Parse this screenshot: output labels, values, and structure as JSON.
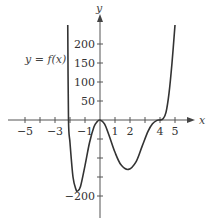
{
  "chart_data": {
    "type": "line",
    "title": "",
    "annotation": "y = f(x)",
    "xlabel": "x",
    "ylabel": "y",
    "xlim": [
      -5.5,
      6
    ],
    "ylim": [
      -240,
      250
    ],
    "x_ticks": [
      -5,
      -4,
      -3,
      -2,
      -1,
      0,
      1,
      2,
      3,
      4,
      5
    ],
    "x_tick_labels": [
      {
        "value": -5,
        "label": "−5"
      },
      {
        "value": -3,
        "label": "−3"
      },
      {
        "value": -1,
        "label": "−1"
      },
      {
        "value": 1,
        "label": "1"
      },
      {
        "value": 2,
        "label": "2"
      },
      {
        "value": 4,
        "label": "4"
      },
      {
        "value": 5,
        "label": "5"
      }
    ],
    "y_ticks": [
      -200,
      -150,
      -100,
      -50,
      50,
      100,
      150,
      200
    ],
    "y_tick_labels": [
      {
        "value": 200,
        "label": "200"
      },
      {
        "value": 150,
        "label": "150"
      },
      {
        "value": 100,
        "label": "100"
      },
      {
        "value": 50,
        "label": "50"
      },
      {
        "value": -200,
        "label": "−200"
      }
    ],
    "grid": false,
    "series": [
      {
        "name": "f(x)",
        "x": [
          -2.15,
          -2.1,
          -2.0,
          -1.8,
          -1.6,
          -1.5,
          -1.3,
          -1.0,
          -0.7,
          -0.4,
          -0.2,
          0.0,
          0.3,
          0.6,
          1.0,
          1.4,
          1.9,
          2.4,
          2.8,
          3.2,
          3.5,
          3.8,
          4.0,
          4.2,
          4.4,
          4.6,
          4.8,
          5.0
        ],
        "y": [
          250,
          0,
          -60,
          -150,
          -183,
          -187,
          -175,
          -120,
          -60,
          -18,
          -5,
          0,
          -10,
          -40,
          -85,
          -118,
          -130,
          -110,
          -70,
          -30,
          -10,
          -1,
          0,
          3,
          20,
          70,
          150,
          250
        ]
      }
    ]
  }
}
